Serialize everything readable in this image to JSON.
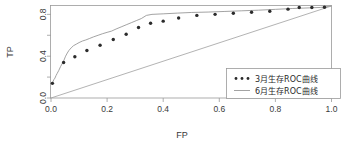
{
  "chart_data": {
    "type": "line",
    "title": "",
    "xlabel": "FP",
    "ylabel": "TP",
    "xlim": [
      0.0,
      1.0
    ],
    "ylim": [
      0.0,
      0.88
    ],
    "grid": false,
    "legend_position": "bottom-right",
    "xticks": [
      "0.0",
      "0.2",
      "0.4",
      "0.6",
      "0.8",
      "1.0"
    ],
    "xtick_values": [
      0.0,
      0.2,
      0.4,
      0.6,
      0.8,
      1.0
    ],
    "yticks": [
      "0.0",
      "0.4",
      "0.8"
    ],
    "ytick_values": [
      0.0,
      0.4,
      0.8
    ],
    "yminor_values": [
      0.2,
      0.6
    ],
    "series": [
      {
        "name": "3月生存ROC曲线",
        "style": "dotted",
        "marker": "circle",
        "color": "#2b2b2b",
        "x": [
          0.005,
          0.045,
          0.085,
          0.128,
          0.175,
          0.222,
          0.268,
          0.312,
          0.355,
          0.4,
          0.455,
          0.52,
          0.585,
          0.65,
          0.715,
          0.78,
          0.845,
          0.885,
          0.93,
          0.975
        ],
        "y": [
          0.14,
          0.34,
          0.395,
          0.455,
          0.505,
          0.56,
          0.61,
          0.675,
          0.715,
          0.735,
          0.765,
          0.79,
          0.8,
          0.81,
          0.82,
          0.83,
          0.85,
          0.865,
          0.865,
          0.868
        ]
      },
      {
        "name": "6月生存ROC曲线",
        "style": "solid",
        "marker": "none",
        "color": "#8c8c8c",
        "x": [
          0.0,
          0.006,
          0.01,
          0.014,
          0.018,
          0.022,
          0.028,
          0.034,
          0.04,
          0.046,
          0.052,
          0.058,
          0.064,
          0.072,
          0.08,
          0.09,
          0.1,
          0.112,
          0.124,
          0.138,
          0.152,
          0.168,
          0.184,
          0.2,
          0.216,
          0.232,
          0.25,
          0.268,
          0.286,
          0.304,
          0.322,
          0.34,
          0.36,
          0.4,
          0.45,
          0.5,
          0.56,
          0.62,
          0.68,
          0.74,
          0.8,
          0.86,
          0.92,
          0.96,
          1.0
        ],
        "y": [
          0.14,
          0.15,
          0.175,
          0.19,
          0.215,
          0.235,
          0.265,
          0.3,
          0.33,
          0.36,
          0.4,
          0.43,
          0.455,
          0.48,
          0.5,
          0.515,
          0.53,
          0.545,
          0.555,
          0.57,
          0.585,
          0.6,
          0.615,
          0.628,
          0.64,
          0.66,
          0.68,
          0.7,
          0.72,
          0.74,
          0.76,
          0.79,
          0.8,
          0.805,
          0.812,
          0.818,
          0.822,
          0.828,
          0.834,
          0.84,
          0.848,
          0.856,
          0.862,
          0.866,
          0.88
        ]
      },
      {
        "name": "reference-diagonal",
        "style": "solid",
        "marker": "none",
        "color": "#a0a0a0",
        "x": [
          0.0,
          1.0
        ],
        "y": [
          0.0,
          0.88
        ]
      }
    ]
  },
  "axes": {
    "x_title": "FP",
    "y_title": "TP"
  },
  "legend": {
    "entries": [
      {
        "label": "3月生存ROC曲线",
        "marker": "dots"
      },
      {
        "label": "6月生存ROC曲线",
        "marker": "line"
      }
    ]
  }
}
